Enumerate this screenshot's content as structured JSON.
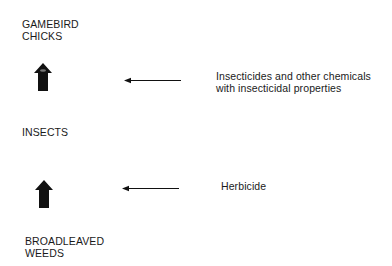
{
  "diagram": {
    "nodes": [
      {
        "id": "gamebird-chicks",
        "lines": [
          "GAMEBIRD",
          "CHICKS"
        ]
      },
      {
        "id": "insects",
        "lines": [
          "INSECTS"
        ]
      },
      {
        "id": "broadleaved-weeds",
        "lines": [
          "BROADLEAVED",
          "WEEDS"
        ]
      }
    ],
    "food_chain_arrows": [
      {
        "from": "insects",
        "to": "gamebird-chicks",
        "icon": "block-up-arrow-icon"
      },
      {
        "from": "broadleaved-weeds",
        "to": "insects",
        "icon": "block-up-arrow-icon"
      }
    ],
    "impacts": [
      {
        "target_link": "insects-to-gamebird-chicks",
        "lines": [
          "Insecticides and other chemicals",
          "with insecticidal properties"
        ],
        "icon": "left-arrow-icon"
      },
      {
        "target_link": "weeds-to-insects",
        "lines": [
          "Herbicide"
        ],
        "icon": "left-arrow-icon"
      }
    ],
    "colors": {
      "text": "#1a1a1a",
      "arrow": "#111111",
      "background": "#ffffff"
    }
  }
}
